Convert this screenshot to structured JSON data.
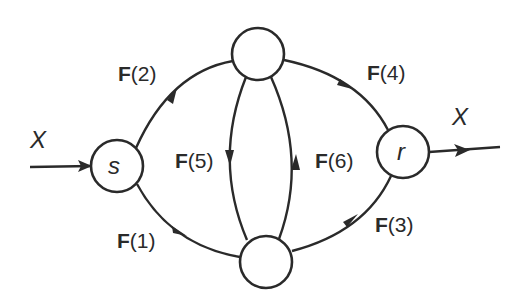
{
  "diagram": {
    "type": "flow-network",
    "stroke_color": "#2a2a2a",
    "background": "#ffffff",
    "input_label": "X",
    "output_label": "X",
    "nodes": [
      {
        "id": "s",
        "label": "s",
        "cx": 117,
        "cy": 166,
        "r": 26
      },
      {
        "id": "top",
        "label": "",
        "cx": 258,
        "cy": 54,
        "r": 26
      },
      {
        "id": "bottom",
        "label": "",
        "cx": 266,
        "cy": 262,
        "r": 26
      },
      {
        "id": "r",
        "label": "r",
        "cx": 403,
        "cy": 152,
        "r": 26
      }
    ],
    "edges": [
      {
        "id": "F1",
        "from": "s",
        "to": "bottom",
        "bold": "F",
        "rest": "(1)"
      },
      {
        "id": "F2",
        "from": "s",
        "to": "top",
        "bold": "F",
        "rest": "(2)"
      },
      {
        "id": "F3",
        "from": "bottom",
        "to": "r",
        "bold": "F",
        "rest": "(3)"
      },
      {
        "id": "F4",
        "from": "top",
        "to": "r",
        "bold": "F",
        "rest": "(4)"
      },
      {
        "id": "F5",
        "from": "top",
        "to": "bottom",
        "bold": "F",
        "rest": "(5)"
      },
      {
        "id": "F6",
        "from": "bottom",
        "to": "top",
        "bold": "F",
        "rest": "(6)"
      }
    ]
  }
}
